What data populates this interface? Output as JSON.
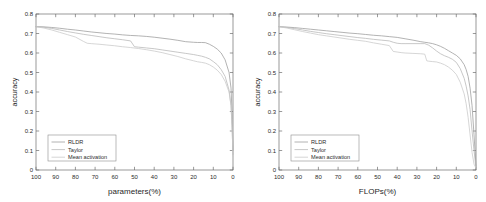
{
  "figure": {
    "panels": [
      "params-panel",
      "flops-panel"
    ]
  },
  "chart_data": [
    {
      "type": "line",
      "title": "",
      "xlabel": "parameters(%)",
      "ylabel": "accuracy",
      "xlim": [
        100,
        0
      ],
      "ylim": [
        0,
        0.8
      ],
      "xticks": [
        100,
        90,
        80,
        70,
        60,
        50,
        40,
        30,
        20,
        10,
        0
      ],
      "yticks": [
        0,
        0.1,
        0.2,
        0.3,
        0.4,
        0.5,
        0.6,
        0.7,
        0.8
      ],
      "ytick_labels": [
        "0",
        "0.1",
        "0.2",
        "0.3",
        "0.4",
        "0.5",
        "0.6",
        "0.7",
        "0.8"
      ],
      "xtick_labels": [
        "100",
        "90",
        "80",
        "70",
        "60",
        "50",
        "40",
        "30",
        "20",
        "10",
        "0"
      ],
      "grid": false,
      "legend_position": "lower left",
      "legend": [
        "RLDR",
        "Taylor",
        "Mean activation"
      ],
      "series": [
        {
          "name": "RLDR",
          "color": "#9a9a9a",
          "x": [
            100,
            96,
            92,
            88,
            84,
            80,
            76,
            72,
            68,
            64,
            60,
            56,
            52,
            48,
            44,
            40,
            36,
            32,
            28,
            24,
            20,
            18,
            16,
            14,
            12,
            10,
            8,
            6,
            4,
            2,
            1,
            0.5,
            0
          ],
          "y": [
            0.735,
            0.734,
            0.731,
            0.727,
            0.722,
            0.718,
            0.713,
            0.708,
            0.704,
            0.7,
            0.697,
            0.693,
            0.69,
            0.688,
            0.685,
            0.681,
            0.676,
            0.671,
            0.665,
            0.658,
            0.655,
            0.654,
            0.654,
            0.653,
            0.645,
            0.634,
            0.62,
            0.6,
            0.565,
            0.5,
            0.42,
            0.3,
            0.1
          ]
        },
        {
          "name": "Taylor",
          "color": "#b5b5b5",
          "x": [
            100,
            96,
            92,
            88,
            84,
            80,
            76,
            72,
            68,
            64,
            60,
            56,
            52,
            50,
            48,
            44,
            40,
            36,
            32,
            28,
            24,
            20,
            18,
            16,
            14,
            12,
            10,
            8,
            6,
            4,
            2,
            1,
            0.5,
            0
          ],
          "y": [
            0.735,
            0.732,
            0.726,
            0.718,
            0.71,
            0.703,
            0.696,
            0.69,
            0.684,
            0.678,
            0.673,
            0.668,
            0.662,
            0.632,
            0.63,
            0.626,
            0.622,
            0.616,
            0.61,
            0.604,
            0.598,
            0.592,
            0.588,
            0.584,
            0.578,
            0.57,
            0.556,
            0.54,
            0.515,
            0.48,
            0.41,
            0.33,
            0.23,
            0.08
          ]
        },
        {
          "name": "Mean activation",
          "color": "#c8c8c8",
          "x": [
            100,
            96,
            92,
            88,
            84,
            80,
            76,
            74,
            72,
            68,
            64,
            60,
            56,
            52,
            48,
            44,
            40,
            36,
            32,
            28,
            24,
            20,
            18,
            16,
            14,
            12,
            10,
            8,
            6,
            4,
            2,
            1,
            0.5,
            0
          ],
          "y": [
            0.735,
            0.728,
            0.718,
            0.706,
            0.694,
            0.682,
            0.66,
            0.65,
            0.648,
            0.645,
            0.641,
            0.637,
            0.632,
            0.628,
            0.623,
            0.617,
            0.61,
            0.602,
            0.592,
            0.582,
            0.57,
            0.56,
            0.555,
            0.552,
            0.548,
            0.54,
            0.528,
            0.512,
            0.49,
            0.455,
            0.4,
            0.33,
            0.23,
            0.07
          ]
        }
      ]
    },
    {
      "type": "line",
      "title": "",
      "xlabel": "FLOPs(%)",
      "ylabel": "accuracy",
      "xlim": [
        100,
        0
      ],
      "ylim": [
        0,
        0.8
      ],
      "xticks": [
        100,
        90,
        80,
        70,
        60,
        50,
        40,
        30,
        20,
        10,
        0
      ],
      "yticks": [
        0,
        0.1,
        0.2,
        0.3,
        0.4,
        0.5,
        0.6,
        0.7,
        0.8
      ],
      "ytick_labels": [
        "0",
        "0.1",
        "0.2",
        "0.3",
        "0.4",
        "0.5",
        "0.6",
        "0.7",
        "0.8"
      ],
      "xtick_labels": [
        "100",
        "90",
        "80",
        "70",
        "60",
        "50",
        "40",
        "30",
        "20",
        "10",
        "0"
      ],
      "grid": false,
      "legend_position": "lower left",
      "legend": [
        "RLDR",
        "Taylor",
        "Mean activation"
      ],
      "series": [
        {
          "name": "RLDR",
          "color": "#9a9a9a",
          "x": [
            100,
            96,
            92,
            88,
            84,
            80,
            76,
            72,
            68,
            64,
            60,
            56,
            52,
            48,
            44,
            40,
            36,
            32,
            28,
            26,
            24,
            22,
            20,
            18,
            16,
            14,
            12,
            10,
            8,
            6,
            5,
            4,
            3,
            2,
            1,
            0.5,
            0
          ],
          "y": [
            0.735,
            0.733,
            0.73,
            0.726,
            0.722,
            0.718,
            0.714,
            0.71,
            0.706,
            0.702,
            0.699,
            0.695,
            0.691,
            0.688,
            0.684,
            0.68,
            0.673,
            0.666,
            0.658,
            0.655,
            0.652,
            0.648,
            0.642,
            0.634,
            0.624,
            0.612,
            0.6,
            0.588,
            0.57,
            0.54,
            0.515,
            0.48,
            0.42,
            0.33,
            0.18,
            0.1,
            0.02
          ]
        },
        {
          "name": "Taylor",
          "color": "#b5b5b5",
          "x": [
            100,
            96,
            92,
            88,
            84,
            80,
            76,
            72,
            68,
            64,
            60,
            56,
            52,
            48,
            44,
            42,
            40,
            38,
            36,
            32,
            28,
            26,
            24,
            22,
            20,
            18,
            16,
            14,
            12,
            10,
            8,
            6,
            5,
            4,
            3,
            2,
            1,
            0
          ],
          "y": [
            0.735,
            0.731,
            0.725,
            0.718,
            0.711,
            0.705,
            0.699,
            0.694,
            0.689,
            0.684,
            0.679,
            0.675,
            0.67,
            0.666,
            0.662,
            0.655,
            0.65,
            0.648,
            0.648,
            0.648,
            0.648,
            0.648,
            0.64,
            0.626,
            0.61,
            0.596,
            0.586,
            0.578,
            0.568,
            0.552,
            0.52,
            0.47,
            0.43,
            0.38,
            0.31,
            0.2,
            0.1,
            0.01
          ]
        },
        {
          "name": "Mean activation",
          "color": "#c8c8c8",
          "x": [
            100,
            96,
            92,
            88,
            84,
            80,
            76,
            72,
            68,
            64,
            60,
            56,
            52,
            48,
            44,
            42,
            40,
            38,
            36,
            32,
            28,
            26,
            25,
            24,
            22,
            20,
            18,
            16,
            14,
            12,
            10,
            8,
            6,
            5,
            4,
            3,
            2,
            1,
            0
          ],
          "y": [
            0.735,
            0.728,
            0.719,
            0.71,
            0.702,
            0.694,
            0.688,
            0.682,
            0.676,
            0.67,
            0.665,
            0.66,
            0.652,
            0.645,
            0.638,
            0.608,
            0.605,
            0.602,
            0.6,
            0.598,
            0.596,
            0.594,
            0.56,
            0.558,
            0.556,
            0.554,
            0.548,
            0.54,
            0.528,
            0.512,
            0.49,
            0.45,
            0.39,
            0.34,
            0.27,
            0.18,
            0.09,
            0.03,
            0.01
          ]
        }
      ]
    }
  ]
}
